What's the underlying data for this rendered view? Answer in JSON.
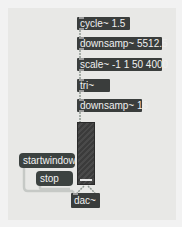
{
  "patcher": {
    "objects": [
      {
        "id": "cycle",
        "text": "cycle~ 1.5"
      },
      {
        "id": "downsamp1",
        "text": "downsamp~ 5512.5"
      },
      {
        "id": "scale",
        "text": "scale~ -1 1 50 4000"
      },
      {
        "id": "tri",
        "text": "tri~"
      },
      {
        "id": "downsamp2",
        "text": "downsamp~ 16"
      },
      {
        "id": "dac",
        "text": "dac~"
      }
    ],
    "messages": [
      {
        "id": "startwindow",
        "text": "startwindow"
      },
      {
        "id": "stop",
        "text": "stop"
      }
    ],
    "meter": {
      "id": "meter",
      "label": ""
    }
  },
  "colors": {
    "object_bg": "#3a3d3c",
    "message_bg": "#3c4240",
    "canvas_bg": "#e8e8e6",
    "cord_signal": "#9aa39f",
    "cord_control": "#c9ccc9"
  }
}
